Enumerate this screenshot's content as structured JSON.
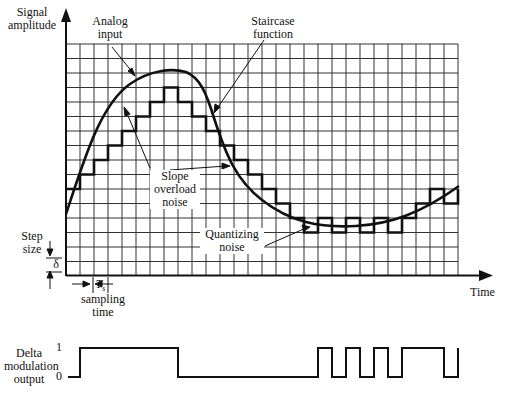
{
  "chart_data": {
    "type": "line",
    "ylabel": "Signal amplitude",
    "xlabel": "Time",
    "grid": true,
    "grid_cols": 28,
    "grid_rows": 16,
    "series": [
      {
        "name": "Analog input",
        "kind": "smooth curve"
      },
      {
        "name": "Staircase function",
        "kind": "step",
        "start_level_row": 10,
        "bits": [
          1,
          1,
          1,
          1,
          1,
          1,
          1,
          0,
          0,
          0,
          0,
          0,
          0,
          0,
          0,
          0,
          0,
          1,
          0,
          1,
          0,
          1,
          0,
          1,
          1,
          1,
          0,
          1
        ]
      }
    ],
    "annotations": [
      "Analog input",
      "Staircase function",
      "Slope overload noise",
      "Quantizing noise",
      "Step size δ",
      "T_s sampling time"
    ],
    "delta_output": {
      "label": "Delta modulation output",
      "levels": [
        "0",
        "1"
      ],
      "bits": [
        1,
        1,
        1,
        1,
        1,
        1,
        1,
        0,
        0,
        0,
        0,
        0,
        0,
        0,
        0,
        0,
        0,
        1,
        0,
        1,
        0,
        1,
        0,
        1,
        1,
        1,
        0,
        1
      ]
    }
  },
  "labels": {
    "y_axis_line1": "Signal",
    "y_axis_line2": "amplitude",
    "x_axis": "Time",
    "analog_line1": "Analog",
    "analog_line2": "input",
    "staircase_line1": "Staircase",
    "staircase_line2": "function",
    "slope_line1": "Slope",
    "slope_line2": "overload",
    "slope_line3": "noise",
    "quant_line1": "Quantizing",
    "quant_line2": "noise",
    "step_line1": "Step",
    "step_line2": "size",
    "delta_symbol": "δ",
    "ts_symbol": "T",
    "ts_sub": "s",
    "sampling_line1": "sampling",
    "sampling_line2": "time",
    "dm_line1": "Delta",
    "dm_line2": "modulation",
    "dm_line3": "output",
    "level_one": "1",
    "level_zero": "0"
  },
  "colors": {
    "ink": "#111111",
    "grid": "#333333",
    "background": "#ffffff"
  }
}
